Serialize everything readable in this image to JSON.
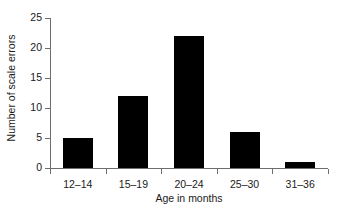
{
  "chart_data": {
    "type": "bar",
    "title": "",
    "xlabel": "Age in months",
    "ylabel": "Number of scale errors",
    "categories": [
      "12–14",
      "15–19",
      "20–24",
      "25–30",
      "31–36"
    ],
    "values": [
      5,
      12,
      22,
      6,
      1
    ],
    "ylim": [
      0,
      25
    ],
    "yticks": [
      0,
      5,
      10,
      15,
      20,
      25
    ],
    "ytick_labels": [
      "0",
      "5",
      "10",
      "15",
      "20",
      "25"
    ],
    "grid": false,
    "legend": null,
    "bar_color": "#000000",
    "axis_color": "#6e6e6e",
    "text_color": "#1a1a1a",
    "background": "#ffffff"
  }
}
